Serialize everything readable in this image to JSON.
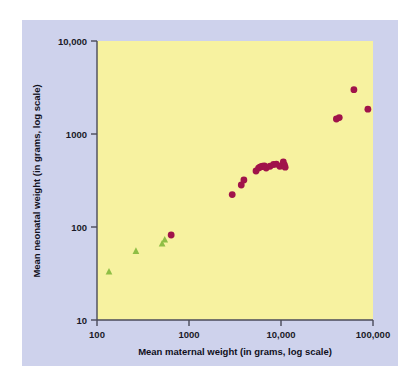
{
  "figure": {
    "panel_background": "#ced2ec",
    "page_background": "#ffffff",
    "plot_background": "#f7f2a0",
    "axis_color": "#4a4a5a"
  },
  "chart_data": {
    "type": "scatter",
    "title": "",
    "subtitle": "",
    "xlabel": "Mean maternal weight (in grams, log scale)",
    "ylabel": "Mean neonatal weight (in grams, log scale)",
    "xscale": "log",
    "yscale": "log",
    "xlim": [
      100,
      100000
    ],
    "ylim": [
      10,
      10000
    ],
    "xticks": [
      100,
      1000,
      10000,
      100000
    ],
    "xtick_labels": [
      "100",
      "1000",
      "10,000",
      "100,000"
    ],
    "yticks": [
      10,
      100,
      1000,
      10000
    ],
    "ytick_labels": [
      "10",
      "100",
      "1000",
      "10,000"
    ],
    "grid": false,
    "legend": "none",
    "series": [
      {
        "name": "small-mammals",
        "marker": "triangle",
        "color": "#8fbe45",
        "points": [
          {
            "x": 135,
            "y": 33
          },
          {
            "x": 265,
            "y": 55
          },
          {
            "x": 510,
            "y": 66
          },
          {
            "x": 545,
            "y": 73
          }
        ]
      },
      {
        "name": "larger-mammals",
        "marker": "circle",
        "color": "#a0134a",
        "points": [
          {
            "x": 640,
            "y": 82
          },
          {
            "x": 2950,
            "y": 223
          },
          {
            "x": 3700,
            "y": 283
          },
          {
            "x": 3950,
            "y": 320
          },
          {
            "x": 5350,
            "y": 400
          },
          {
            "x": 5700,
            "y": 430
          },
          {
            "x": 5900,
            "y": 440
          },
          {
            "x": 6100,
            "y": 445
          },
          {
            "x": 6300,
            "y": 450
          },
          {
            "x": 6600,
            "y": 455
          },
          {
            "x": 6900,
            "y": 430
          },
          {
            "x": 7600,
            "y": 450
          },
          {
            "x": 8300,
            "y": 470
          },
          {
            "x": 8900,
            "y": 475
          },
          {
            "x": 9700,
            "y": 450
          },
          {
            "x": 10200,
            "y": 455
          },
          {
            "x": 10600,
            "y": 500
          },
          {
            "x": 10900,
            "y": 465
          },
          {
            "x": 11100,
            "y": 440
          },
          {
            "x": 40000,
            "y": 1450
          },
          {
            "x": 43000,
            "y": 1500
          },
          {
            "x": 62000,
            "y": 3000
          },
          {
            "x": 88000,
            "y": 1850
          }
        ]
      }
    ]
  }
}
